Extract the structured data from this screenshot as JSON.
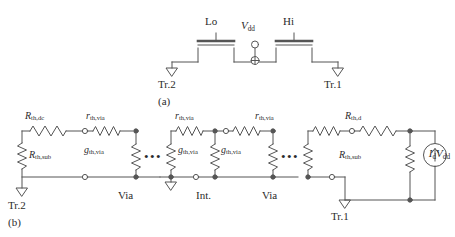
{
  "figure": {
    "caption_a": "(a)",
    "caption_b": "(b)"
  },
  "panel_a": {
    "gate_lo_label": "Lo",
    "gate_hi_label": "Hi",
    "supply_symbol": "V",
    "supply_sub": "dd",
    "ground_left_label": "Tr.2",
    "ground_right_label": "Tr.1"
  },
  "panel_b": {
    "r_th_dc": {
      "main": "R",
      "sub": "th,dc"
    },
    "r_th_via_left": {
      "main": "r",
      "sub": "th,via"
    },
    "r_th_via_mid": {
      "main": "r",
      "sub": "th,via"
    },
    "r_th_via_right": {
      "main": "r",
      "sub": "th,via"
    },
    "g_th_via_left": {
      "main": "g",
      "sub": "th,via"
    },
    "g_th_via_mid": {
      "main": "g",
      "sub": "th,via"
    },
    "g_th_via_right": {
      "main": "g",
      "sub": "th,via"
    },
    "r_th_sub_left": {
      "main": "R",
      "sub": "th,sub"
    },
    "r_th_sub_right": {
      "main": "R",
      "sub": "th,sub"
    },
    "r_th_d": {
      "main": "R",
      "sub": "th,d"
    },
    "current_source": {
      "main_i": "I",
      "sub_i": "d",
      "main_v": "V",
      "sub_v": "dd"
    },
    "region_via_left": "Via",
    "region_int": "Int.",
    "region_via_right": "Via",
    "ground_tr2_label": "Tr.2",
    "ground_tr1_label": "Tr.1",
    "ellipsis": "•••"
  },
  "style": {
    "line_color": "#555555",
    "text_color": "#2b2b2b",
    "background": "#ffffff"
  }
}
